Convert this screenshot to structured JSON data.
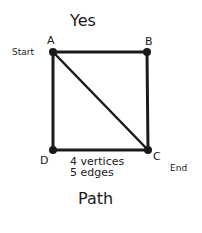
{
  "diagram": {
    "title": "Yes",
    "caption": "Path",
    "info": {
      "vertices": "4 vertices",
      "edges": "5 edges"
    },
    "vertices": [
      {
        "id": "A",
        "x": 53,
        "y": 52,
        "note": "Start"
      },
      {
        "id": "B",
        "x": 147,
        "y": 52,
        "note": ""
      },
      {
        "id": "C",
        "x": 148,
        "y": 150,
        "note": "End"
      },
      {
        "id": "D",
        "x": 53,
        "y": 150,
        "note": ""
      }
    ],
    "edges": [
      [
        "A",
        "B"
      ],
      [
        "B",
        "C"
      ],
      [
        "C",
        "D"
      ],
      [
        "D",
        "A"
      ],
      [
        "A",
        "C"
      ]
    ],
    "colors": {
      "ink": "#1a1a1a",
      "background": "#ffffff"
    }
  }
}
